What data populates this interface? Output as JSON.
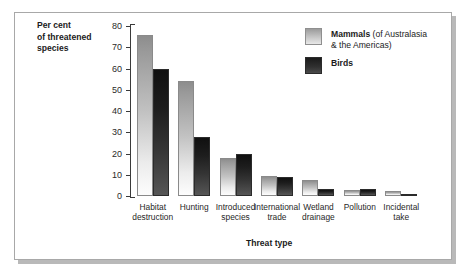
{
  "chart_data": {
    "type": "bar",
    "title": "",
    "xlabel": "Threat type",
    "ylabel": "Per cent of threatened species",
    "ylim": [
      0,
      80
    ],
    "yticks": [
      0,
      10,
      20,
      30,
      40,
      50,
      60,
      70,
      80
    ],
    "grid": false,
    "legend_position": "top-right",
    "categories": [
      "Habitat destruction",
      "Hunting",
      "Introduced species",
      "International trade",
      "Wetland drainage",
      "Pollution",
      "Incidental take"
    ],
    "series": [
      {
        "name": "Mammals (of Australasia & the Americas)",
        "color": "#c2c2c2",
        "values": [
          76,
          54,
          18,
          9.5,
          7.5,
          3,
          2.5
        ]
      },
      {
        "name": "Birds",
        "color": "#2b2b2b",
        "values": [
          60,
          28,
          20,
          9,
          3.5,
          3.5,
          1
        ]
      }
    ]
  },
  "axes": {
    "y_title_lines": [
      "Per cent",
      "of threatened",
      "species"
    ],
    "y_tick_labels": [
      "80",
      "70",
      "60",
      "50",
      "40",
      "30",
      "20",
      "10",
      "0"
    ],
    "x_title": "Threat type"
  },
  "category_labels": [
    [
      "Habitat",
      "destruction"
    ],
    [
      "Hunting",
      ""
    ],
    [
      "Introduced",
      "species"
    ],
    [
      "International",
      "trade"
    ],
    [
      "Wetland",
      "drainage"
    ],
    [
      "Pollution",
      ""
    ],
    [
      "Incidental",
      "take"
    ]
  ],
  "legend": {
    "items": [
      {
        "lead": "Mammals",
        "sub": "(of Australasia",
        "sub2": "& the Americas)",
        "swatch": "mammals"
      },
      {
        "lead": "Birds",
        "sub": "",
        "sub2": "",
        "swatch": "birds"
      }
    ]
  },
  "colors": {
    "frame_border": "#a8a8a8",
    "frame_shadow": "#b9b9b9",
    "axis": "#3a3a3a",
    "text": "#1b1b1b",
    "mammals_top": "#8d8d8d",
    "mammals_bottom": "#fdfdfd",
    "birds_top": "#101010",
    "birds_bottom": "#565656"
  }
}
